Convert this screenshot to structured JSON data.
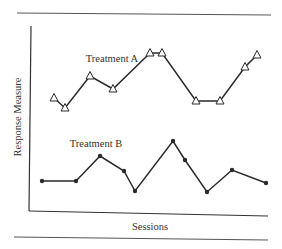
{
  "chart_data": {
    "type": "line",
    "title": "",
    "xlabel": "Sessions",
    "ylabel": "Response Measure",
    "grid": false,
    "legend": "inline labels",
    "x_ticks": [],
    "y_ticks": [],
    "series": [
      {
        "name": "Treatment A",
        "marker": "open-triangle",
        "x": [
          1,
          2,
          3,
          4,
          5,
          6,
          7,
          8,
          9,
          10
        ],
        "px_x": [
          54,
          65,
          90,
          113,
          150,
          162,
          196,
          220,
          245,
          257
        ],
        "px_y": [
          98,
          108,
          76,
          89,
          53,
          53,
          101,
          101,
          67,
          55
        ],
        "values": [
          61,
          56,
          73,
          66,
          85,
          85,
          59,
          59,
          78,
          84
        ]
      },
      {
        "name": "Treatment B",
        "marker": "filled-dot",
        "x": [
          1,
          2,
          3,
          4,
          5,
          6,
          7,
          8,
          9,
          10
        ],
        "px_x": [
          42,
          76,
          100,
          124,
          135,
          173,
          185,
          207,
          232,
          266
        ],
        "px_y": [
          181,
          181,
          156,
          171,
          191,
          141,
          160,
          192,
          170,
          183
        ],
        "values": [
          16,
          16,
          30,
          22,
          11,
          38,
          27,
          10,
          22,
          15
        ]
      }
    ],
    "label_positions": {
      "Treatment A": [
        112,
        62
      ],
      "Treatment B": [
        96,
        147
      ]
    }
  },
  "labels": {
    "series_a": "Treatment A",
    "series_b": "Treatment B",
    "xlabel": "Sessions",
    "ylabel": "Response Measure"
  },
  "colors": {
    "ink": "#2a2a2a",
    "rule": "#555555",
    "background": "#ffffff"
  }
}
